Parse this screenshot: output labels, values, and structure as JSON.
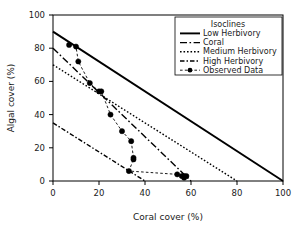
{
  "chart_data": {
    "type": "line",
    "title": "",
    "xlabel": "Coral cover (%)",
    "ylabel": "Algal cover (%)",
    "xlim": [
      0,
      100
    ],
    "ylim": [
      0,
      100
    ],
    "xticks": [
      0,
      20,
      40,
      60,
      80,
      100
    ],
    "yticks": [
      0,
      20,
      40,
      60,
      80,
      100
    ],
    "grid": false,
    "legend_position": "top-right",
    "legend_title": "Isoclines",
    "series": [
      {
        "name": "Low Herbivory",
        "style": "solid",
        "marker": "none",
        "color": "#000000",
        "x": [
          0,
          100
        ],
        "y": [
          90,
          0
        ]
      },
      {
        "name": "Coral",
        "style": "long-dash-dot",
        "marker": "none",
        "color": "#000000",
        "x": [
          0,
          60
        ],
        "y": [
          80,
          0
        ]
      },
      {
        "name": "Medium Herbivory",
        "style": "dotted",
        "marker": "none",
        "color": "#000000",
        "x": [
          0,
          80
        ],
        "y": [
          70,
          0
        ]
      },
      {
        "name": "High Herbivory",
        "style": "dash-dot",
        "marker": "none",
        "color": "#000000",
        "x": [
          0,
          40
        ],
        "y": [
          35,
          0
        ]
      },
      {
        "name": "Observed Data",
        "style": "dashed",
        "marker": "filled-circle",
        "color": "#000000",
        "x": [
          7,
          10,
          11,
          16,
          20,
          21,
          25,
          30,
          34,
          35,
          35,
          33,
          54,
          56,
          57,
          57,
          58
        ],
        "y": [
          82,
          81,
          72,
          59,
          54,
          54,
          40,
          30,
          24,
          14,
          13,
          6,
          4,
          3,
          3,
          2,
          3
        ]
      }
    ]
  },
  "axes": {
    "x_title": "Coral cover (%)",
    "y_title": "Algal cover (%)",
    "x_tick_labels": [
      "0",
      "20",
      "40",
      "60",
      "80",
      "100"
    ],
    "y_tick_labels": [
      "0",
      "20",
      "40",
      "60",
      "80",
      "100"
    ]
  },
  "legend": {
    "title": "Isoclines",
    "items": [
      {
        "label": "Low Herbivory",
        "key": "low-herbivory"
      },
      {
        "label": "Coral",
        "key": "coral"
      },
      {
        "label": "Medium Herbivory",
        "key": "medium-herbivory"
      },
      {
        "label": "High Herbivory",
        "key": "high-herbivory"
      },
      {
        "label": "Observed Data",
        "key": "observed-data"
      }
    ]
  },
  "colors": {
    "ink": "#000000",
    "background": "#ffffff"
  }
}
